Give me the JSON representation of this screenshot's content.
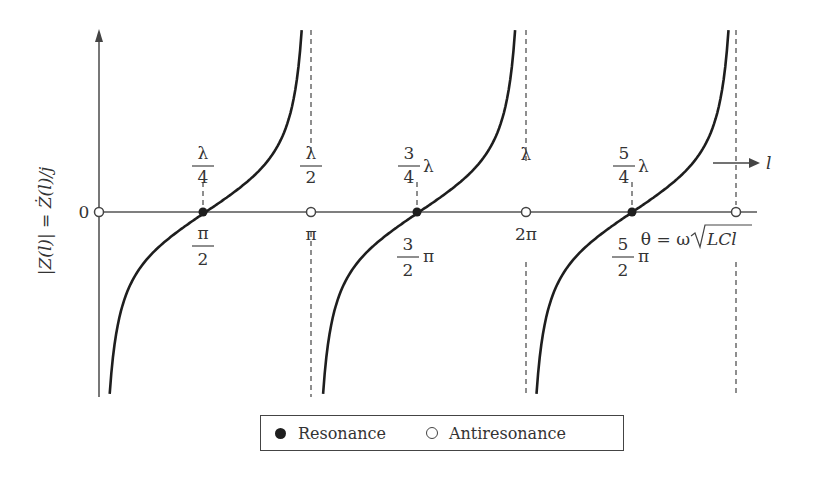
{
  "chart_data": {
    "type": "line",
    "title": "",
    "ylabel": "|Z(l)| = Ż(l)/j",
    "xlabel": "θ = ω√(LCl)",
    "x_direction_label": "l",
    "y_origin_label": "0",
    "x_axis_unit": "radians (θ)",
    "function": "|Z| ∝ -cot(θ) (shorted transmission line reactance vs. electrical length)",
    "asymptotes_theta": [
      "0",
      "π",
      "2π",
      "3π"
    ],
    "resonance_points": [
      {
        "theta": "π/2",
        "length": "λ/4",
        "theta_value": 1.5708
      },
      {
        "theta": "3π/2",
        "length": "3λ/4",
        "theta_value": 4.7124
      },
      {
        "theta": "5π/2",
        "length": "5λ/4",
        "theta_value": 7.854
      }
    ],
    "antiresonance_points": [
      {
        "theta": "0",
        "length": "0",
        "theta_value": 0
      },
      {
        "theta": "π",
        "length": "λ/2",
        "theta_value": 3.1416
      },
      {
        "theta": "2π",
        "length": "λ",
        "theta_value": 6.2832
      },
      {
        "theta": "3π",
        "length": "",
        "theta_value": 9.4248
      }
    ],
    "legend": [
      {
        "marker": "filled-circle",
        "label": "Resonance"
      },
      {
        "marker": "open-circle",
        "label": "Antiresonance"
      }
    ],
    "legend_position": "bottom-center",
    "grid": false
  },
  "labels": {
    "y_axis": "|Z(l)| = Ż(l)/j",
    "zero": "0",
    "top": [
      {
        "num": "λ",
        "den": "4",
        "suffix": ""
      },
      {
        "num": "λ",
        "den": "2",
        "suffix": ""
      },
      {
        "num": "3",
        "den": "4",
        "suffix": "λ"
      },
      {
        "plain": "λ"
      },
      {
        "num": "5",
        "den": "4",
        "suffix": "λ"
      }
    ],
    "bottom": [
      {
        "num": "π",
        "den": "2",
        "suffix": ""
      },
      {
        "plain": "π"
      },
      {
        "num": "3",
        "den": "2",
        "suffix": "π"
      },
      {
        "plain": "2π"
      },
      {
        "num": "5",
        "den": "2",
        "suffix": "π"
      }
    ],
    "theta_eq": "θ = ω",
    "sqrt_arg": "LCl",
    "l_arrow": "l"
  },
  "legend": {
    "resonance": "Resonance",
    "antiresonance": "Antiresonance"
  }
}
